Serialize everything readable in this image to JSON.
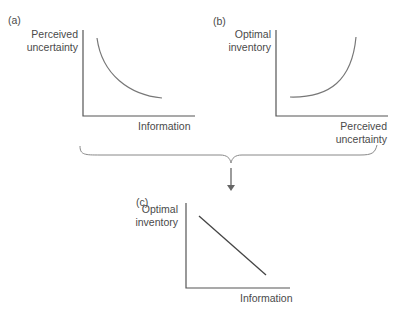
{
  "panels": [
    {
      "id": "a",
      "tag": "(a)",
      "ylabel_line1": "Perceived",
      "ylabel_line2": "uncertainty",
      "xlabel": "Information",
      "curve": "decreasing convex"
    },
    {
      "id": "b",
      "tag": "(b)",
      "ylabel_line1": "Optimal",
      "ylabel_line2": "inventory",
      "xlabel_line1": "Perceived",
      "xlabel_line2": "uncertainty",
      "curve": "increasing convex"
    },
    {
      "id": "c",
      "tag": "(c)",
      "ylabel_line1": "Optimal",
      "ylabel_line2": "inventory",
      "xlabel": "Information",
      "curve": "decreasing linear"
    }
  ],
  "colors": {
    "axis": "#555555",
    "curve": "#666666",
    "text": "#4a4a4a"
  }
}
